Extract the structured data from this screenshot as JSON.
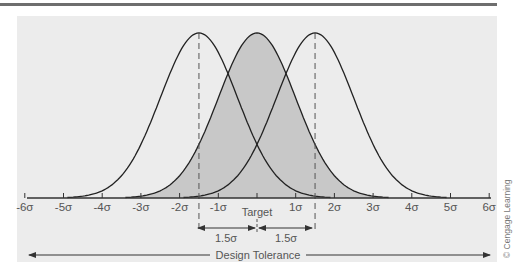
{
  "diagram": {
    "title": "",
    "axis_ticks": [
      "-6σ",
      "-5σ",
      "-4σ",
      "-3σ",
      "-2σ",
      "-1σ",
      "",
      "1σ",
      "2σ",
      "3σ",
      "4σ",
      "5σ",
      "6σ"
    ],
    "target_label": "Target",
    "shift_left_label": "1.5σ",
    "shift_right_label": "1.5σ",
    "design_tolerance_label": "Design Tolerance",
    "credit": "© Cengage Learning",
    "colors": {
      "panel_bg": "#ececec",
      "shade": "#c8c8c8",
      "curve": "#222222",
      "axis": "#333333",
      "top_rule": "#6e6e6e"
    },
    "curves": [
      {
        "name": "shifted-left",
        "mean_sigma": -1.5,
        "shaded": false
      },
      {
        "name": "centered",
        "mean_sigma": 0,
        "shaded": true
      },
      {
        "name": "shifted-right",
        "mean_sigma": 1.5,
        "shaded": false
      }
    ]
  }
}
